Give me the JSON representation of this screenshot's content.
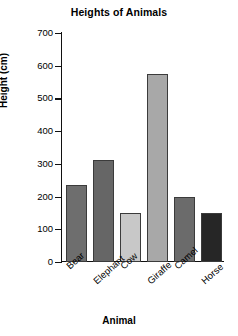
{
  "chart_data": {
    "type": "bar",
    "title": "Heights of Animals",
    "xlabel": "Animal",
    "ylabel": "Height (cm)",
    "categories": [
      "Bear",
      "Elephant",
      "Cow",
      "Giraffe",
      "Camel",
      "Horse"
    ],
    "values": [
      235,
      313,
      150,
      575,
      200,
      150
    ],
    "bar_colors": [
      "#6e6e6e",
      "#666666",
      "#c8c8c8",
      "#a8a8a8",
      "#6b6b6b",
      "#262626"
    ],
    "ylim": [
      0,
      700
    ],
    "ytick_labels": [
      "700",
      "600",
      "500",
      "400",
      "300",
      "200",
      "100",
      "0"
    ],
    "ytick_values": [
      700,
      600,
      500,
      400,
      300,
      200,
      100,
      0
    ],
    "grid": false,
    "legend": "none",
    "axis_color": "#111111",
    "background": "#ffffff"
  }
}
